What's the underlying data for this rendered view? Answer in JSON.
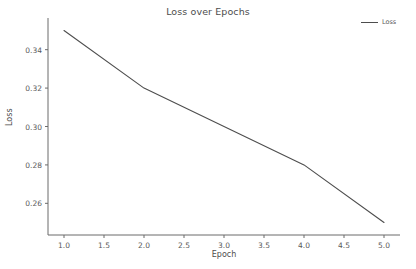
{
  "chart_data": {
    "type": "line",
    "title": "Loss over Epochs",
    "xlabel": "Epoch",
    "ylabel": "Loss",
    "x": [
      1,
      2,
      3,
      4,
      5
    ],
    "series": [
      {
        "name": "Loss",
        "values": [
          0.35,
          0.32,
          0.3,
          0.28,
          0.25
        ],
        "color": "#4d4d4d"
      }
    ],
    "xlim": [
      0.8,
      5.2
    ],
    "ylim": [
      0.2435,
      0.3565
    ],
    "xticks": [
      1.0,
      1.5,
      2.0,
      2.5,
      3.0,
      3.5,
      4.0,
      4.5,
      5.0
    ],
    "xtick_labels": [
      "1.0",
      "1.5",
      "2.0",
      "2.5",
      "3.0",
      "3.5",
      "4.0",
      "4.5",
      "5.0"
    ],
    "yticks": [
      0.26,
      0.28,
      0.3,
      0.32,
      0.34
    ],
    "ytick_labels": [
      "0.26",
      "0.28",
      "0.30",
      "0.32",
      "0.34"
    ],
    "grid": false,
    "legend_position": "upper right",
    "legend_entries": [
      "Loss"
    ],
    "axis_color": "#6b6b6b",
    "background": "#ffffff"
  }
}
